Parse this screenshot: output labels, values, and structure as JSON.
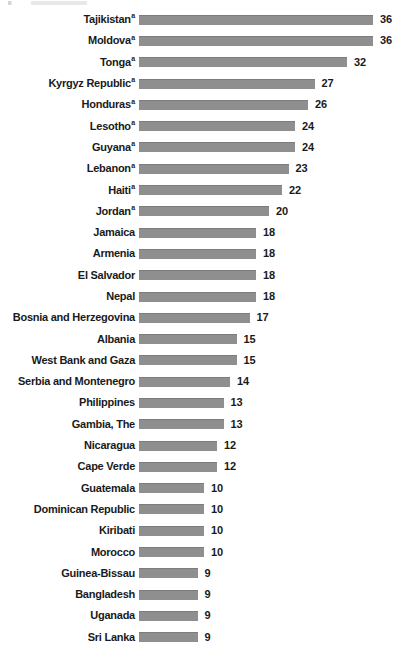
{
  "chart_data": {
    "type": "bar",
    "orientation": "horizontal",
    "title": "",
    "subtitle": "",
    "xlabel": "",
    "ylabel": "",
    "grid": false,
    "legend": false,
    "axis_visible": false,
    "value_labels_shown": true,
    "xlim": [
      0,
      36
    ],
    "bar_color": "#8f8f8f",
    "text_color": "#1a1a1a",
    "background_color": "#ffffff",
    "footnote_marker": "a",
    "categories": [
      "Tajikistan",
      "Moldova",
      "Tonga",
      "Kyrgyz Republic",
      "Honduras",
      "Lesotho",
      "Guyana",
      "Lebanon",
      "Haiti",
      "Jordan",
      "Jamaica",
      "Armenia",
      "El Salvador",
      "Nepal",
      "Bosnia and Herzegovina",
      "Albania",
      "West Bank and Gaza",
      "Serbia and Montenegro",
      "Philippines",
      "Gambia, The",
      "Nicaragua",
      "Cape Verde",
      "Guatemala",
      "Dominican Republic",
      "Kiribati",
      "Morocco",
      "Guinea-Bissau",
      "Bangladesh",
      "Uganada",
      "Sri Lanka"
    ],
    "values": [
      36,
      36,
      32,
      27,
      26,
      24,
      24,
      23,
      22,
      20,
      18,
      18,
      18,
      18,
      17,
      15,
      15,
      14,
      13,
      13,
      12,
      12,
      10,
      10,
      10,
      10,
      9,
      9,
      9,
      9
    ],
    "rows": [
      {
        "category": "Tajikistan",
        "value": 36,
        "marker": "a"
      },
      {
        "category": "Moldova",
        "value": 36,
        "marker": "a"
      },
      {
        "category": "Tonga",
        "value": 32,
        "marker": "a"
      },
      {
        "category": "Kyrgyz Republic",
        "value": 27,
        "marker": "a"
      },
      {
        "category": "Honduras",
        "value": 26,
        "marker": "a"
      },
      {
        "category": "Lesotho",
        "value": 24,
        "marker": "a"
      },
      {
        "category": "Guyana",
        "value": 24,
        "marker": "a"
      },
      {
        "category": "Lebanon",
        "value": 23,
        "marker": "a"
      },
      {
        "category": "Haiti",
        "value": 22,
        "marker": "a"
      },
      {
        "category": "Jordan",
        "value": 20,
        "marker": "a"
      },
      {
        "category": "Jamaica",
        "value": 18,
        "marker": ""
      },
      {
        "category": "Armenia",
        "value": 18,
        "marker": ""
      },
      {
        "category": "El Salvador",
        "value": 18,
        "marker": ""
      },
      {
        "category": "Nepal",
        "value": 18,
        "marker": ""
      },
      {
        "category": "Bosnia and Herzegovina",
        "value": 17,
        "marker": ""
      },
      {
        "category": "Albania",
        "value": 15,
        "marker": ""
      },
      {
        "category": "West Bank and Gaza",
        "value": 15,
        "marker": ""
      },
      {
        "category": "Serbia and Montenegro",
        "value": 14,
        "marker": ""
      },
      {
        "category": "Philippines",
        "value": 13,
        "marker": ""
      },
      {
        "category": "Gambia, The",
        "value": 13,
        "marker": ""
      },
      {
        "category": "Nicaragua",
        "value": 12,
        "marker": ""
      },
      {
        "category": "Cape Verde",
        "value": 12,
        "marker": ""
      },
      {
        "category": "Guatemala",
        "value": 10,
        "marker": ""
      },
      {
        "category": "Dominican Republic",
        "value": 10,
        "marker": ""
      },
      {
        "category": "Kiribati",
        "value": 10,
        "marker": ""
      },
      {
        "category": "Morocco",
        "value": 10,
        "marker": ""
      },
      {
        "category": "Guinea-Bissau",
        "value": 9,
        "marker": ""
      },
      {
        "category": "Bangladesh",
        "value": 9,
        "marker": ""
      },
      {
        "category": "Uganada",
        "value": 9,
        "marker": ""
      },
      {
        "category": "Sri Lanka",
        "value": 9,
        "marker": ""
      }
    ]
  }
}
